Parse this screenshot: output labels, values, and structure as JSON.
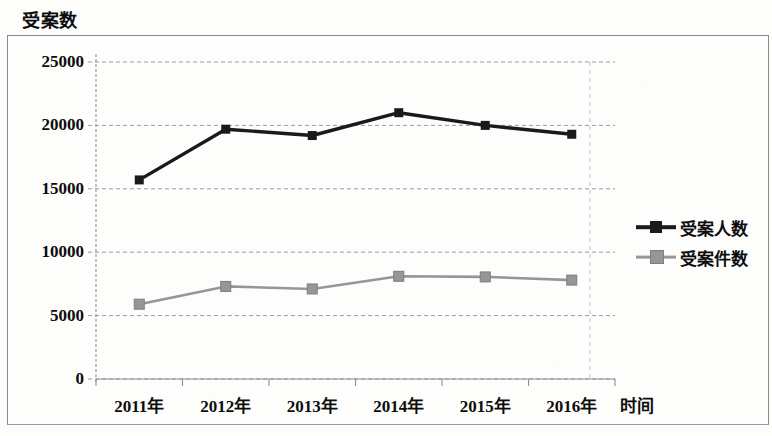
{
  "axis_title_y": "受案数",
  "axis_title_x": "时间",
  "legend": {
    "items": [
      {
        "label": "受案人数",
        "color": "#1a1a1a"
      },
      {
        "label": "受案件数",
        "color": "#969696"
      }
    ]
  },
  "chart_data": {
    "type": "line",
    "title": "",
    "xlabel": "时间",
    "ylabel": "受案数",
    "categories": [
      "2011年",
      "2012年",
      "2013年",
      "2014年",
      "2015年",
      "2016年"
    ],
    "series": [
      {
        "name": "受案人数",
        "color": "#1a1a1a",
        "marker": "square",
        "values": [
          15700,
          19700,
          19200,
          21000,
          20000,
          19300
        ]
      },
      {
        "name": "受案件数",
        "color": "#969696",
        "marker": "square",
        "values": [
          5900,
          7300,
          7100,
          8100,
          8050,
          7800
        ]
      }
    ],
    "ylim": [
      0,
      25000
    ],
    "yticks": [
      0,
      5000,
      10000,
      15000,
      20000,
      25000
    ],
    "ytick_labels": [
      "0",
      "5000",
      "10000",
      "15000",
      "20000",
      "25000"
    ],
    "grid": true,
    "grid_style": "dashed",
    "legend_position": "right"
  }
}
